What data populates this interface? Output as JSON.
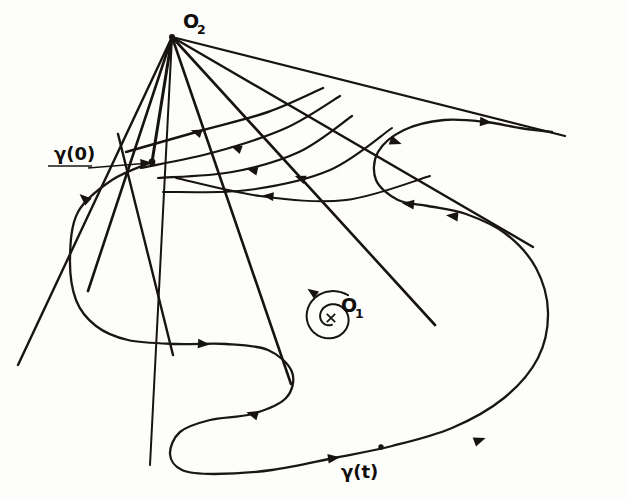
{
  "figure": {
    "kind": "mathematical-diagram",
    "background_color": "#fdfdfc",
    "ink_color": "#17140f",
    "width": 626,
    "height": 500
  },
  "labels": {
    "origin_two": {
      "base": "O",
      "subscript": "2",
      "x": 183,
      "y": 28
    },
    "origin_one": {
      "base": "O",
      "subscript": "1",
      "x": 341,
      "y": 312
    },
    "gamma_zero": {
      "text": "γ(0)",
      "x": 54,
      "y": 160
    },
    "gamma_t": {
      "text": "γ(t)",
      "x": 341,
      "y": 478
    }
  },
  "points": {
    "apex_o2": {
      "name": "O2",
      "x": 172,
      "y": 37
    },
    "node_gamma0": {
      "name": "gamma(0)",
      "x": 152,
      "y": 162
    },
    "center_o1": {
      "name": "O1",
      "x": 331,
      "y": 318
    },
    "point_gamma_t": {
      "name": "gamma(t)",
      "x": 381,
      "y": 447
    }
  },
  "chart_data": {
    "type": "line",
    "title": "",
    "xlabel": "",
    "ylabel": "",
    "grid": false,
    "legend": "none",
    "rays_from_O2": [
      {
        "id": "ray-1",
        "from": [
          172,
          37
        ],
        "to": [
          18,
          365
        ],
        "width": 2.4
      },
      {
        "id": "ray-2",
        "from": [
          172,
          37
        ],
        "to": [
          88,
          291
        ],
        "width": 2.6
      },
      {
        "id": "ray-3",
        "from": [
          172,
          37
        ],
        "to": [
          152,
          162
        ],
        "width": 3.0
      },
      {
        "id": "ray-4",
        "from": [
          172,
          37
        ],
        "to": [
          150,
          465
        ],
        "width": 2.0
      },
      {
        "id": "ray-5",
        "from": [
          172,
          37
        ],
        "to": [
          291,
          384
        ],
        "width": 2.6
      },
      {
        "id": "ray-6",
        "from": [
          172,
          37
        ],
        "to": [
          435,
          325
        ],
        "width": 2.6
      },
      {
        "id": "ray-7",
        "from": [
          172,
          37
        ],
        "to": [
          533,
          247
        ],
        "width": 2.4
      },
      {
        "id": "ray-8",
        "from": [
          172,
          37
        ],
        "to": [
          565,
          136
        ],
        "width": 2.2
      }
    ],
    "crossing_ray": {
      "id": "ray-cross",
      "from": [
        118,
        134
      ],
      "to": [
        173,
        355
      ],
      "width": 2.4
    },
    "arcs": [
      {
        "id": "arc-1",
        "path": [
          [
            126,
            152
          ],
          [
            200,
            131
          ],
          [
            268,
            112
          ],
          [
            323,
            88
          ]
        ],
        "width": 2.4,
        "arrow_at": [
          196,
          132
        ],
        "arrow_dir": 198
      },
      {
        "id": "arc-2",
        "path": [
          [
            141,
            168
          ],
          [
            215,
            152
          ],
          [
            286,
            128
          ],
          [
            340,
            96
          ]
        ],
        "width": 2.2,
        "arrow_at": [
          236,
          148
        ],
        "arrow_dir": 200
      },
      {
        "id": "arc-3",
        "path": [
          [
            158,
            178
          ],
          [
            232,
            172
          ],
          [
            299,
            152
          ],
          [
            352,
            116
          ]
        ],
        "width": 2.2,
        "arrow_at": [
          252,
          170
        ],
        "arrow_dir": 193
      },
      {
        "id": "arc-4",
        "path": [
          [
            163,
            192
          ],
          [
            248,
            190
          ],
          [
            330,
            170
          ],
          [
            392,
            128
          ]
        ],
        "width": 2.0,
        "arrow_at": [
          300,
          178
        ],
        "arrow_dir": 200
      },
      {
        "id": "arc-5",
        "path": [
          [
            176,
            178
          ],
          [
            260,
            196
          ],
          [
            346,
            200
          ],
          [
            430,
            176
          ]
        ],
        "width": 2.0,
        "arrow_at": [
          268,
          196
        ],
        "arrow_dir": 186
      }
    ],
    "flow_curve_gamma": {
      "id": "gamma-curve",
      "width": 2.3,
      "path": [
        [
          152,
          162
        ],
        [
          112,
          180
        ],
        [
          78,
          212
        ],
        [
          70,
          258
        ],
        [
          76,
          300
        ],
        [
          96,
          326
        ],
        [
          128,
          340
        ],
        [
          176,
          344
        ],
        [
          226,
          344
        ],
        [
          268,
          350
        ],
        [
          292,
          372
        ],
        [
          286,
          398
        ],
        [
          252,
          414
        ],
        [
          210,
          420
        ],
        [
          180,
          432
        ],
        [
          170,
          454
        ],
        [
          182,
          470
        ],
        [
          214,
          474
        ],
        [
          272,
          470
        ],
        [
          334,
          458
        ],
        [
          392,
          446
        ],
        [
          452,
          428
        ],
        [
          504,
          398
        ],
        [
          538,
          358
        ],
        [
          548,
          312
        ],
        [
          536,
          268
        ],
        [
          506,
          234
        ],
        [
          466,
          214
        ],
        [
          428,
          206
        ],
        [
          398,
          200
        ],
        [
          376,
          180
        ],
        [
          378,
          152
        ],
        [
          404,
          130
        ],
        [
          444,
          120
        ],
        [
          486,
          122
        ],
        [
          520,
          128
        ],
        [
          552,
          132
        ]
      ],
      "arrows": [
        {
          "at": [
            84,
            198
          ],
          "dir": 222
        },
        {
          "at": [
            204,
            344
          ],
          "dir": 4
        },
        {
          "at": [
            252,
            414
          ],
          "dir": 196
        },
        {
          "at": [
            334,
            458
          ],
          "dir": 352
        },
        {
          "at": [
            480,
            440
          ],
          "dir": 340
        },
        {
          "at": [
            452,
            216
          ],
          "dir": 186
        },
        {
          "at": [
            408,
            204
          ],
          "dir": 186
        },
        {
          "at": [
            396,
            142
          ],
          "dir": 20
        },
        {
          "at": [
            486,
            122
          ],
          "dir": 4
        }
      ],
      "dots": [
        [
          381,
          447
        ]
      ]
    },
    "spiral_o1": {
      "id": "spiral-orbit",
      "center": [
        331,
        318
      ],
      "radius_outer": 29,
      "width": 2.0,
      "direction": "counterclockwise",
      "arrow_at": [
        312,
        292
      ],
      "arrow_dir": 215
    },
    "leader_gamma0": {
      "from": [
        88,
        168
      ],
      "to": [
        150,
        163
      ],
      "arrow_dir": 356
    },
    "leader_gamma0_underline": {
      "from": [
        48,
        166
      ],
      "to": [
        92,
        166
      ]
    }
  }
}
